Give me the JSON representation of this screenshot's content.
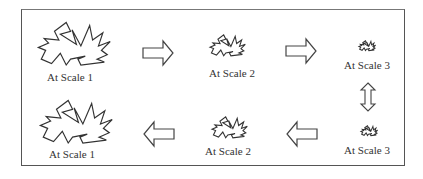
{
  "diagram": {
    "rows": [
      {
        "direction": "left-to-right",
        "stages": [
          {
            "label": "At Scale 1",
            "scale": 1
          },
          {
            "label": "At Scale 2",
            "scale": 2
          },
          {
            "label": "At Scale 3",
            "scale": 3
          }
        ]
      },
      {
        "direction": "right-to-left",
        "stages": [
          {
            "label": "At Scale 1",
            "scale": 1
          },
          {
            "label": "At Scale 2",
            "scale": 2
          },
          {
            "label": "At Scale 3",
            "scale": 3
          }
        ]
      }
    ],
    "arrows": [
      {
        "name": "arrow-right-1",
        "direction": "right"
      },
      {
        "name": "arrow-right-2",
        "direction": "right"
      },
      {
        "name": "arrow-updown",
        "direction": "up-down"
      },
      {
        "name": "arrow-left-1",
        "direction": "left"
      },
      {
        "name": "arrow-left-2",
        "direction": "left"
      }
    ],
    "colors": {
      "stroke": "#333333",
      "border": "#555555",
      "background": "#ffffff"
    }
  }
}
